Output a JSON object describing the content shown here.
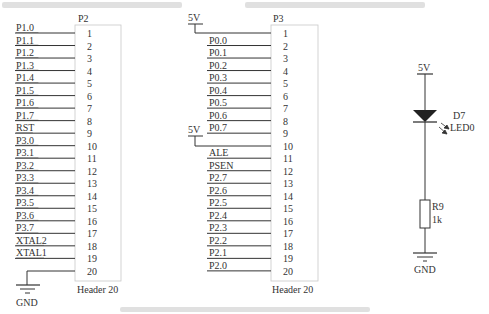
{
  "connectors": [
    {
      "ref": "P2",
      "footprint": "Header 20",
      "pins": [
        {
          "num": "1",
          "net": "P1.0"
        },
        {
          "num": "2",
          "net": "P1.1"
        },
        {
          "num": "3",
          "net": "P1.2"
        },
        {
          "num": "4",
          "net": "P1.3"
        },
        {
          "num": "5",
          "net": "P1.4"
        },
        {
          "num": "6",
          "net": "P1.5"
        },
        {
          "num": "7",
          "net": "P1.6"
        },
        {
          "num": "8",
          "net": "P1.7"
        },
        {
          "num": "9",
          "net": "RST"
        },
        {
          "num": "10",
          "net": "P3.0"
        },
        {
          "num": "11",
          "net": "P3.1"
        },
        {
          "num": "12",
          "net": "P3.2"
        },
        {
          "num": "13",
          "net": "P3.3"
        },
        {
          "num": "14",
          "net": "P3.4"
        },
        {
          "num": "15",
          "net": "P3.5"
        },
        {
          "num": "16",
          "net": "P3.6"
        },
        {
          "num": "17",
          "net": "P3.7"
        },
        {
          "num": "18",
          "net": "XTAL2"
        },
        {
          "num": "19",
          "net": "XTAL1"
        },
        {
          "num": "20",
          "net": "GND"
        }
      ]
    },
    {
      "ref": "P3",
      "footprint": "Header 20",
      "pins": [
        {
          "num": "1",
          "net": "5V"
        },
        {
          "num": "2",
          "net": "P0.0"
        },
        {
          "num": "3",
          "net": "P0.1"
        },
        {
          "num": "4",
          "net": "P0.2"
        },
        {
          "num": "5",
          "net": "P0.3"
        },
        {
          "num": "6",
          "net": "P0.4"
        },
        {
          "num": "7",
          "net": "P0.5"
        },
        {
          "num": "8",
          "net": "P0.6"
        },
        {
          "num": "9",
          "net": "P0.7"
        },
        {
          "num": "10",
          "net": "5V"
        },
        {
          "num": "11",
          "net": "ALE"
        },
        {
          "num": "12",
          "net": "PSEN"
        },
        {
          "num": "13",
          "net": "P2.7"
        },
        {
          "num": "14",
          "net": "P2.6"
        },
        {
          "num": "15",
          "net": "P2.5"
        },
        {
          "num": "16",
          "net": "P2.4"
        },
        {
          "num": "17",
          "net": "P2.3"
        },
        {
          "num": "18",
          "net": "P2.2"
        },
        {
          "num": "19",
          "net": "P2.1"
        },
        {
          "num": "20",
          "net": "P2.0"
        }
      ]
    }
  ],
  "power_labels": {
    "vcc": "5V",
    "gnd": "GND"
  },
  "led_circuit": {
    "supply": "5V",
    "diode_ref": "D7",
    "diode_value": "LED0",
    "resistor_ref": "R9",
    "resistor_value": "1k",
    "ground": "GND"
  }
}
